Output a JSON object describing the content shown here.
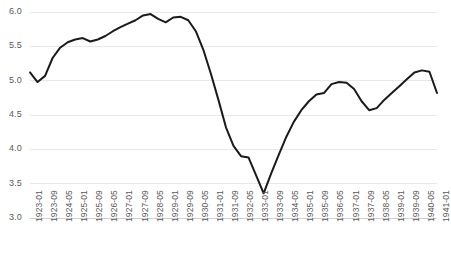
{
  "chart_data": {
    "type": "line",
    "title": "",
    "subtitle": "",
    "xlabel": "",
    "ylabel": "",
    "grid": true,
    "legend": "none",
    "ylim": [
      3.0,
      6.0
    ],
    "ytick_labels": [
      "6.0",
      "5.5",
      "5.0",
      "4.5",
      "4.0",
      "3.5",
      "3.0"
    ],
    "ytick_values": [
      6.0,
      5.5,
      5.0,
      4.5,
      4.0,
      3.5,
      3.0
    ],
    "xtick_labels": [
      "1923-01",
      "1923-09",
      "1924-05",
      "1925-01",
      "1925-09",
      "1926-05",
      "1927-01",
      "1927-09",
      "1928-05",
      "1929-01",
      "1929-09",
      "1930-05",
      "1931-01",
      "1931-09",
      "1932-05",
      "1933-01",
      "1933-09",
      "1934-05",
      "1935-01",
      "1935-09",
      "1936-05",
      "1937-01",
      "1937-09",
      "1938-05",
      "1939-01",
      "1939-09",
      "1940-05",
      "1941-01"
    ],
    "series": [
      {
        "name": "series-1",
        "color": "#1a1a1a",
        "x": [
          "1923-01",
          "1923-05",
          "1923-09",
          "1924-01",
          "1924-05",
          "1924-09",
          "1925-01",
          "1925-05",
          "1925-09",
          "1926-01",
          "1926-05",
          "1926-09",
          "1927-01",
          "1927-05",
          "1927-09",
          "1928-01",
          "1928-05",
          "1928-09",
          "1929-01",
          "1929-05",
          "1929-09",
          "1930-01",
          "1930-05",
          "1930-09",
          "1931-01",
          "1931-05",
          "1931-09",
          "1932-01",
          "1932-05",
          "1932-09",
          "1933-01",
          "1933-05",
          "1933-09",
          "1934-01",
          "1934-05",
          "1934-09",
          "1935-01",
          "1935-05",
          "1935-09",
          "1936-01",
          "1936-05",
          "1936-09",
          "1937-01",
          "1937-05",
          "1937-09",
          "1938-01",
          "1938-05",
          "1938-09",
          "1939-01",
          "1939-05",
          "1939-09",
          "1940-01",
          "1940-05",
          "1940-09",
          "1941-01"
        ],
        "values": [
          5.12,
          4.98,
          5.07,
          5.33,
          5.48,
          5.56,
          5.6,
          5.62,
          5.57,
          5.6,
          5.65,
          5.72,
          5.78,
          5.83,
          5.88,
          5.95,
          5.97,
          5.9,
          5.85,
          5.92,
          5.93,
          5.88,
          5.72,
          5.45,
          5.1,
          4.72,
          4.32,
          4.05,
          3.9,
          3.88,
          3.62,
          3.36,
          3.65,
          3.92,
          4.18,
          4.4,
          4.57,
          4.7,
          4.8,
          4.82,
          4.95,
          4.98,
          4.97,
          4.88,
          4.7,
          4.57,
          4.6,
          4.72,
          4.82,
          4.92,
          5.02,
          5.12,
          5.15,
          5.13,
          4.82
        ]
      }
    ]
  },
  "axis": {
    "plot_left": 30,
    "plot_right": 437,
    "plot_top": 12,
    "plot_bottom": 218
  }
}
